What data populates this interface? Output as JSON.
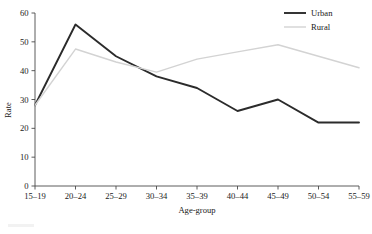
{
  "chart_data": {
    "type": "line",
    "title": "",
    "subtitle": "",
    "xlabel": "Age-group",
    "ylabel": "Rate",
    "categories": [
      "15–19",
      "20–24",
      "25–29",
      "30–34",
      "35–39",
      "40–44",
      "45–49",
      "50–54",
      "55–59"
    ],
    "series": [
      {
        "name": "Urban",
        "color": "#2b2b2b",
        "width": 1.9,
        "values": [
          28,
          56,
          45,
          38,
          34,
          26,
          30,
          22,
          22
        ]
      },
      {
        "name": "Rural",
        "color": "#d3d3d3",
        "width": 1.4,
        "values": [
          28,
          47.5,
          43,
          39.5,
          44,
          46.5,
          49,
          45,
          41
        ]
      }
    ],
    "ylim": [
      0,
      60
    ],
    "yticks": [
      0,
      10,
      20,
      30,
      40,
      50,
      60
    ],
    "ytick_labels": [
      "0",
      "10",
      "20",
      "30",
      "40",
      "50",
      "60"
    ],
    "grid": false,
    "legend_position": "top-right"
  },
  "legend": {
    "items": [
      {
        "label": "Urban"
      },
      {
        "label": "Rural"
      }
    ]
  },
  "axes": {
    "y_title": "Rate",
    "x_title": "Age-group"
  }
}
